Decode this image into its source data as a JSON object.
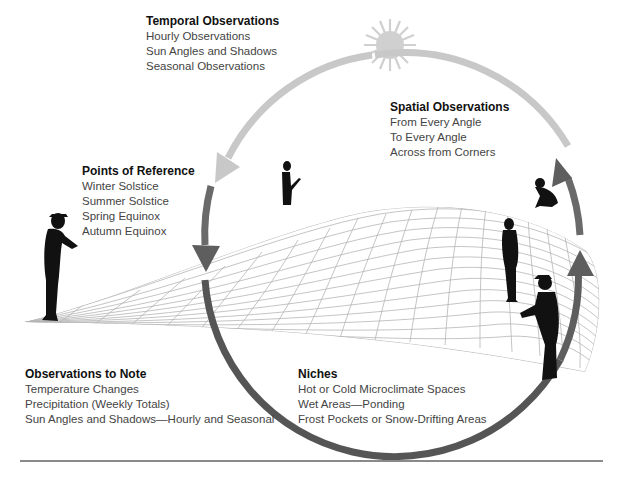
{
  "diagram": {
    "colors": {
      "arc_dark": "#555555",
      "arc_mid": "#6e6e6e",
      "arc_light": "#c8c8c8",
      "sun": "#d0d0d0",
      "grid": "#b5b5b5",
      "figure": "#111111",
      "rule": "#8a8a8a"
    },
    "icons": [
      "sun-icon",
      "person-silhouette",
      "crouching-person-silhouette",
      "grid-surface",
      "cycle-arrow"
    ]
  },
  "temporal": {
    "title": "Temporal Observations",
    "items": [
      "Hourly Observations",
      "Sun Angles and Shadows",
      "Seasonal Observations"
    ]
  },
  "spatial": {
    "title": "Spatial Observations",
    "items": [
      "From Every Angle",
      "To Every Angle",
      "Across from Corners"
    ]
  },
  "reference": {
    "title": "Points of Reference",
    "items": [
      "Winter Solstice",
      "Summer Solstice",
      "Spring Equinox",
      "Autumn Equinox"
    ]
  },
  "observations": {
    "title": "Observations to Note",
    "items": [
      "Temperature Changes",
      "Precipitation (Weekly Totals)",
      "Sun Angles and Shadows—Hourly and Seasonal"
    ]
  },
  "niches": {
    "title": "Niches",
    "items": [
      "Hot or Cold Microclimate Spaces",
      "Wet Areas—Ponding",
      "Frost Pockets or Snow-Drifting Areas"
    ]
  }
}
